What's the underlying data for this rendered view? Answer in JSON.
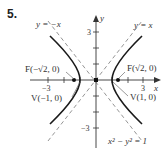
{
  "problem_number": "5.",
  "equation": "x² − y² = 1",
  "axes": {
    "x_label": "x",
    "y_label": "y"
  },
  "ticks": {
    "x_neg": "−3",
    "x_pos": "3",
    "y_pos": "3",
    "y_neg": "−3"
  },
  "asymptotes": {
    "pos": "y = x",
    "neg": "y = −x"
  },
  "foci": {
    "left": "F(−√2, 0)",
    "right": "F(√2, 0)"
  },
  "vertices": {
    "left": "V(−1, 0)",
    "right": "V(1, 0)"
  },
  "colors": {
    "curve": "#1a1a1a",
    "axis": "#333333",
    "asymptote": "#777777"
  }
}
